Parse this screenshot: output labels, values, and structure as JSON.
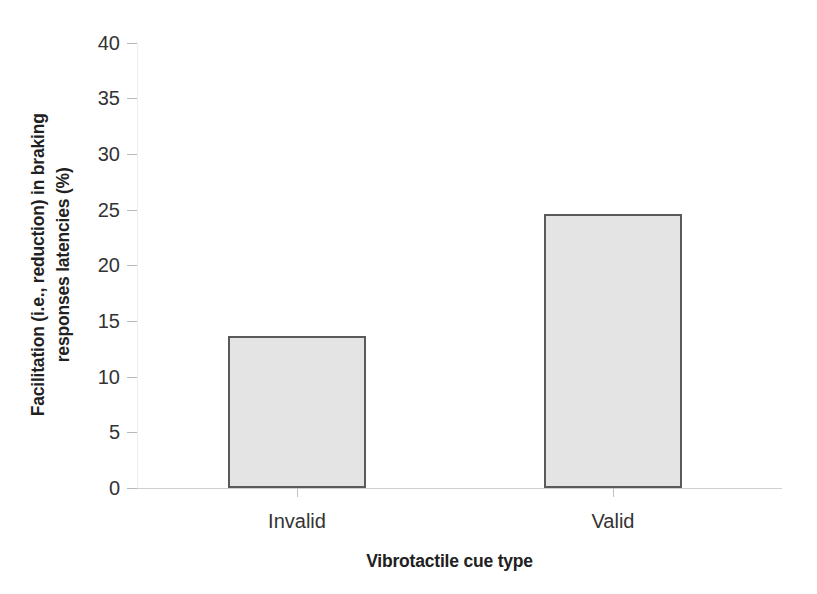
{
  "chart_data": {
    "type": "bar",
    "title": "",
    "categories": [
      "Invalid",
      "Valid"
    ],
    "values": [
      13.7,
      24.6
    ],
    "xlabel": "Vibrotactile cue type",
    "ylabel_line1": "Facilitation (i.e., reduction) in braking",
    "ylabel_line2": "responses latencies (%)",
    "ylabel": "Facilitation (i.e., reduction) in braking responses latencies (%)",
    "ylim": [
      0,
      40
    ],
    "yticks": [
      "0",
      "5",
      "10",
      "15",
      "20",
      "25",
      "30",
      "35",
      "40"
    ],
    "ytick_values": [
      0,
      5,
      10,
      15,
      20,
      25,
      30,
      35,
      40
    ],
    "grid": false,
    "legend": false,
    "legend_position": "none",
    "bar_fill_color": "#e4e4e4",
    "bar_border_color": "#5a5a5a",
    "axis_color": "#c2c2c2",
    "text_color": "#333333"
  }
}
